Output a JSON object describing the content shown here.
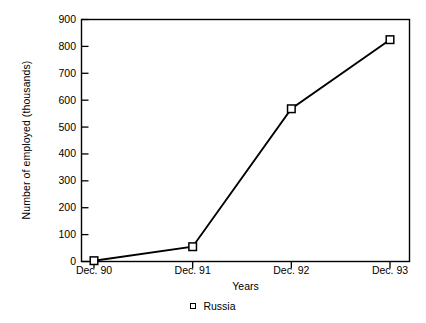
{
  "chart_data": {
    "type": "line",
    "title": "",
    "subtitle": "",
    "xlabel": "Years",
    "ylabel": "Number of employed (thousands)",
    "categories": [
      "Dec. 90",
      "Dec. 91",
      "Dec. 92",
      "Dec. 93"
    ],
    "series": [
      {
        "name": "Russia",
        "values": [
          3,
          55,
          568,
          825
        ],
        "marker": "open-square",
        "color": "#000000"
      }
    ],
    "ylim": [
      0,
      900
    ],
    "yticks": [
      0,
      100,
      200,
      300,
      400,
      500,
      600,
      700,
      800,
      900
    ],
    "ytick_labels": [
      "0",
      "100",
      "200",
      "300",
      "400",
      "500",
      "600",
      "700",
      "800",
      "900"
    ],
    "grid": false,
    "legend": {
      "position": "bottom-center",
      "entries": [
        {
          "label": "Russia",
          "marker": "open-square"
        }
      ]
    },
    "frame": "box",
    "background_color": "#ffffff",
    "line_color": "#000000",
    "axis_color": "#000000"
  }
}
